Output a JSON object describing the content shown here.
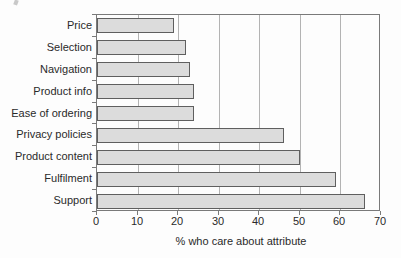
{
  "chart_data": {
    "type": "bar",
    "orientation": "horizontal",
    "title": "",
    "xlabel": "% who care about attribute",
    "ylabel": "",
    "categories": [
      "Price",
      "Selection",
      "Navigation",
      "Product info",
      "Ease of ordering",
      "Privacy policies",
      "Product content",
      "Fulfilment",
      "Support"
    ],
    "values": [
      19,
      22,
      23,
      24,
      24,
      46,
      50,
      59,
      66
    ],
    "xlim": [
      0,
      70
    ],
    "x_ticks": [
      0,
      10,
      20,
      30,
      40,
      50,
      60,
      70
    ],
    "grid": "vertical-gridlines",
    "legend": "none",
    "colors": {
      "bar_fill": "#dcdcdc",
      "bar_border": "#5f5f5f",
      "plot_border": "#7a7a7a",
      "gridline": "#b3b3b3",
      "background": "#fdfdfd",
      "text": "#2a2a2a"
    }
  }
}
